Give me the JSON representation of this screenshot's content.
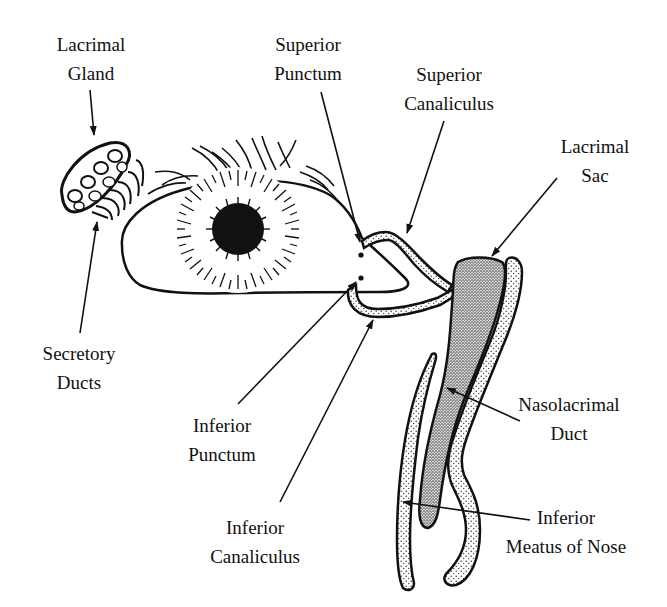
{
  "diagram": {
    "colors": {
      "ink": "#111111",
      "background": "#ffffff",
      "stipple": "#555555"
    },
    "labels": [
      {
        "id": "lacrimal-gland",
        "line1": "Lacrimal",
        "line2": "Gland"
      },
      {
        "id": "superior-punctum",
        "line1": "Superior",
        "line2": "Punctum"
      },
      {
        "id": "superior-canaliculus",
        "line1": "Superior",
        "line2": "Canaliculus"
      },
      {
        "id": "lacrimal-sac",
        "line1": "Lacrimal",
        "line2": "Sac"
      },
      {
        "id": "secretory-ducts",
        "line1": "Secretory",
        "line2": "Ducts"
      },
      {
        "id": "inferior-punctum",
        "line1": "Inferior",
        "line2": "Punctum"
      },
      {
        "id": "nasolacrimal-duct",
        "line1": "Nasolacrimal",
        "line2": "Duct"
      },
      {
        "id": "inferior-canaliculus",
        "line1": "Inferior",
        "line2": "Canaliculus"
      },
      {
        "id": "inferior-meatus",
        "line1": "Inferior",
        "line2": "Meatus of Nose"
      }
    ]
  }
}
